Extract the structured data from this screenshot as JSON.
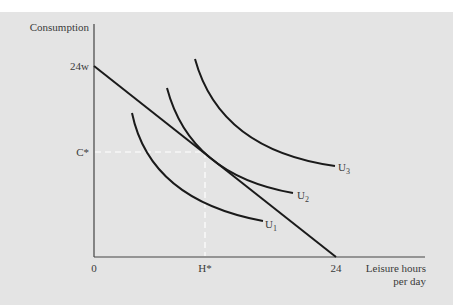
{
  "axes": {
    "y_label": "Consumption",
    "x_label_line1": "Leisure hours",
    "x_label_line2": "per day",
    "origin": "0",
    "y_intercept": "24w",
    "x_intercept": "24",
    "c_star": "C*",
    "h_star": "H*"
  },
  "curves": {
    "u1": {
      "label": "U",
      "sub": "1"
    },
    "u2": {
      "label": "U",
      "sub": "2"
    },
    "u3": {
      "label": "U",
      "sub": "3"
    }
  },
  "colors": {
    "panel": "#e4e4e4",
    "curve": "#1a1a1a",
    "axis": "#444444",
    "dashed": "#ffffff"
  }
}
